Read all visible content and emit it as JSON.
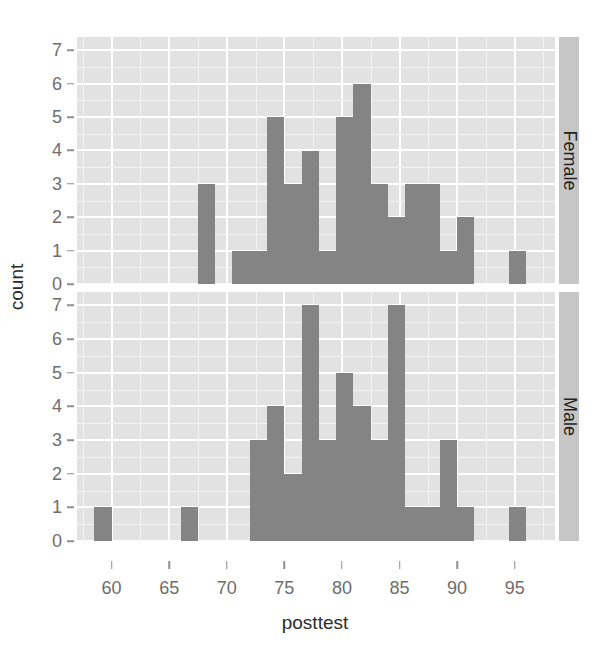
{
  "chart_data": {
    "type": "bar",
    "title": "",
    "xlabel": "posttest",
    "ylabel": "count",
    "binwidth": 1.5,
    "xlim": [
      57.0,
      98.5
    ],
    "ylim": [
      0,
      7.4
    ],
    "x_ticks": [
      60,
      65,
      70,
      75,
      80,
      85,
      90,
      95
    ],
    "y_ticks": [
      0,
      1,
      2,
      3,
      4,
      5,
      6,
      7
    ],
    "grid": true,
    "legend": "none",
    "facet_labels": [
      "Female",
      "Male"
    ],
    "facet_position": "right",
    "bar_color": "#848484",
    "panel_color": "#e2e2e2",
    "series": [
      {
        "name": "Female",
        "bins": [
          {
            "x0": 67.5,
            "x1": 69.0,
            "count": 3
          },
          {
            "x0": 70.5,
            "x1": 72.0,
            "count": 1
          },
          {
            "x0": 72.0,
            "x1": 73.5,
            "count": 1
          },
          {
            "x0": 73.5,
            "x1": 75.0,
            "count": 5
          },
          {
            "x0": 75.0,
            "x1": 76.5,
            "count": 3
          },
          {
            "x0": 76.5,
            "x1": 78.0,
            "count": 4
          },
          {
            "x0": 78.0,
            "x1": 79.5,
            "count": 1
          },
          {
            "x0": 79.5,
            "x1": 81.0,
            "count": 5
          },
          {
            "x0": 81.0,
            "x1": 82.5,
            "count": 6
          },
          {
            "x0": 82.5,
            "x1": 84.0,
            "count": 3
          },
          {
            "x0": 84.0,
            "x1": 85.5,
            "count": 2
          },
          {
            "x0": 85.5,
            "x1": 87.0,
            "count": 3
          },
          {
            "x0": 87.0,
            "x1": 88.5,
            "count": 3
          },
          {
            "x0": 88.5,
            "x1": 90.0,
            "count": 1
          },
          {
            "x0": 90.0,
            "x1": 91.5,
            "count": 2
          },
          {
            "x0": 94.5,
            "x1": 96.0,
            "count": 1
          }
        ]
      },
      {
        "name": "Male",
        "bins": [
          {
            "x0": 58.5,
            "x1": 60.0,
            "count": 1
          },
          {
            "x0": 66.0,
            "x1": 67.5,
            "count": 1
          },
          {
            "x0": 72.0,
            "x1": 73.5,
            "count": 3
          },
          {
            "x0": 73.5,
            "x1": 75.0,
            "count": 4
          },
          {
            "x0": 75.0,
            "x1": 76.5,
            "count": 2
          },
          {
            "x0": 76.5,
            "x1": 78.0,
            "count": 7
          },
          {
            "x0": 78.0,
            "x1": 79.5,
            "count": 3
          },
          {
            "x0": 79.5,
            "x1": 81.0,
            "count": 5
          },
          {
            "x0": 81.0,
            "x1": 82.5,
            "count": 4
          },
          {
            "x0": 82.5,
            "x1": 84.0,
            "count": 3
          },
          {
            "x0": 84.0,
            "x1": 85.5,
            "count": 7
          },
          {
            "x0": 85.5,
            "x1": 87.0,
            "count": 1
          },
          {
            "x0": 87.0,
            "x1": 88.5,
            "count": 1
          },
          {
            "x0": 88.5,
            "x1": 90.0,
            "count": 3
          },
          {
            "x0": 90.0,
            "x1": 91.5,
            "count": 1
          },
          {
            "x0": 94.5,
            "x1": 96.0,
            "count": 1
          }
        ]
      }
    ]
  }
}
